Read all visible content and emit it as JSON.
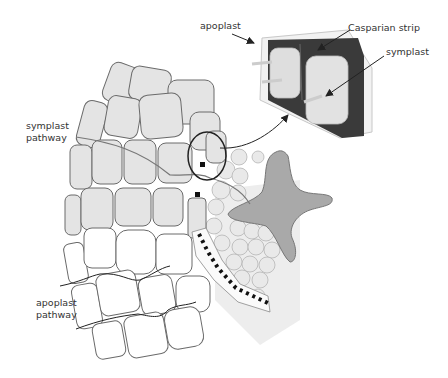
{
  "figure": {
    "labels": {
      "apoplast": "apoplast",
      "casparian_strip": "Casparian strip",
      "symplast": "symplast",
      "symplast_pathway_line1": "symplast",
      "symplast_pathway_line2": "pathway",
      "apoplast_pathway_line1": "apoplast",
      "apoplast_pathway_line2": "pathway"
    },
    "colors": {
      "cell_fill": "#e4e4e4",
      "cell_outline": "#6a6a6a",
      "casparian_strip": "#3a3a3a",
      "xylem_star": "#a8a8a8",
      "dotted_path": "#111111",
      "text": "#333333"
    },
    "elements": [
      "cortex-cells-symplast-region",
      "cortex-cells-apoplast-region",
      "endodermis-magnify-circle",
      "endodermis-inset-casparian-strip",
      "stele-small-cells",
      "xylem-star",
      "apoplast-dotted-path"
    ]
  }
}
